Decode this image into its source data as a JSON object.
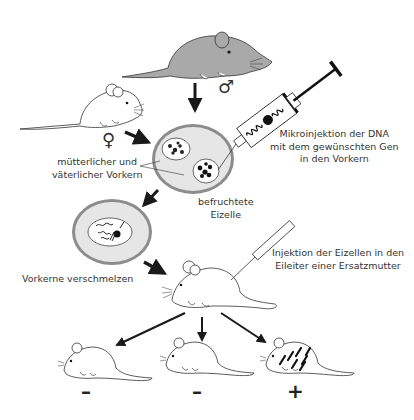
{
  "diagram": {
    "type": "process-flow",
    "topic": "Erzeugung transgener Mäuse durch DNA-Mikroinjektion",
    "symbols": {
      "female": "♀",
      "male": "♂"
    },
    "labels": {
      "pronuclei_line1": "mütterlicher und",
      "pronuclei_line2": "väterlicher Vorkern",
      "fertilized_line1": "befruchtete",
      "fertilized_line2": "Eizelle",
      "microinjection_line1": "Mikroinjektion der DNA",
      "microinjection_line2": "mit dem gewünschten Gen",
      "microinjection_line3": "in den Vorkern",
      "fusion": "Vorkerne verschmelzen",
      "transfer_line1": "Injektion der Eizellen in den",
      "transfer_line2": "Eileiter einer Ersatzmutter"
    },
    "offspring": [
      {
        "sign": "–",
        "transgenic": false
      },
      {
        "sign": "–",
        "transgenic": false
      },
      {
        "sign": "+",
        "transgenic": true
      }
    ],
    "colors": {
      "line": "#1a1a1a",
      "gray_mouse": "#a9a9a9",
      "cytoplasm": "#e6e6e6",
      "zona": "#8c8c8c"
    }
  }
}
